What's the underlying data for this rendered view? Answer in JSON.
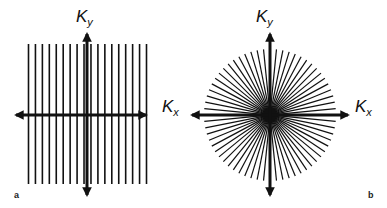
{
  "figure": {
    "panel_a": {
      "label": "a",
      "description": "Cartesian k-space sampling: parallel vertical lines",
      "line_count": 18,
      "axis_x_label": "K",
      "axis_x_sub": "x",
      "axis_y_label": "K",
      "axis_y_sub": "y"
    },
    "panel_b": {
      "label": "b",
      "description": "Radial k-space sampling: spokes through the origin",
      "spoke_count": 32,
      "axis_x_label": "K",
      "axis_x_sub": "x",
      "axis_y_label": "K",
      "axis_y_sub": "y"
    },
    "colors": {
      "line": "#111111",
      "background": "#ffffff"
    }
  }
}
